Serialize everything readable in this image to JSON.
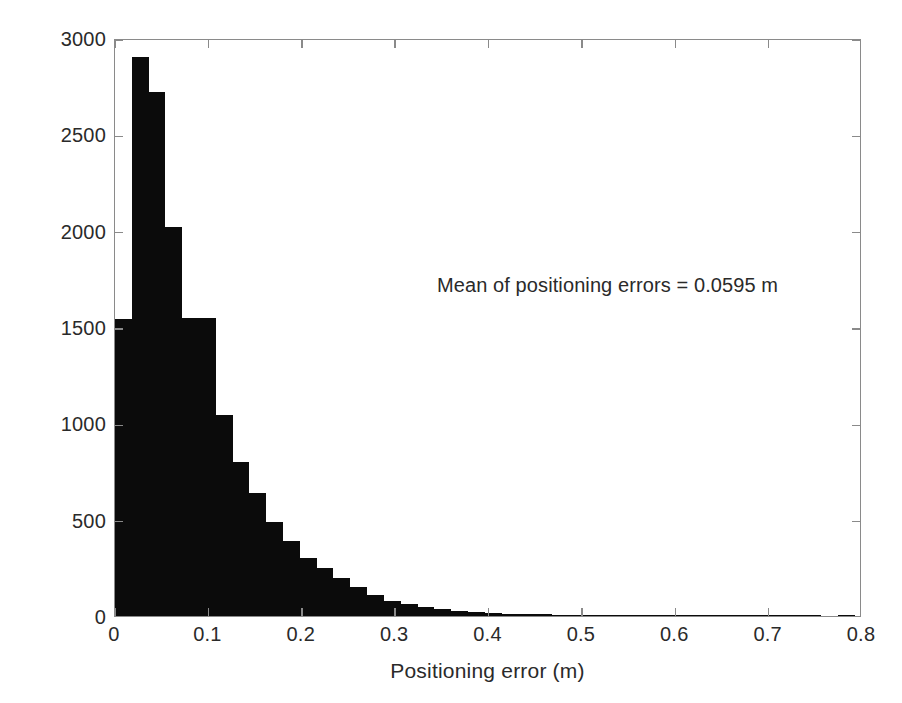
{
  "chart_data": {
    "type": "bar",
    "title": "",
    "subtitle": "",
    "xlabel": "Positioning error (m)",
    "ylabel": "Number of positioning errors",
    "xlim": [
      0,
      0.8
    ],
    "ylim": [
      0,
      3000
    ],
    "grid": false,
    "legend": null,
    "bin_width": 0.018,
    "xticks": [
      "0",
      "0.1",
      "0.2",
      "0.3",
      "0.4",
      "0.5",
      "0.6",
      "0.7",
      "0.8"
    ],
    "xtick_values": [
      0,
      0.1,
      0.2,
      0.3,
      0.4,
      0.5,
      0.6,
      0.7,
      0.8
    ],
    "yticks": [
      "0",
      "500",
      "1000",
      "1500",
      "2000",
      "2500",
      "3000"
    ],
    "ytick_values": [
      0,
      500,
      1000,
      1500,
      2000,
      2500,
      3000
    ],
    "bar_color": "#0b0b0b",
    "frame_color": "#8a8a8a",
    "annotations": [
      {
        "text": "Mean of positioning errors = 0.0595 m",
        "x": 0.345,
        "y": 1780
      }
    ],
    "bin_edges": [
      0.0,
      0.018,
      0.036,
      0.054,
      0.072,
      0.09,
      0.108,
      0.126,
      0.144,
      0.162,
      0.18,
      0.198,
      0.216,
      0.234,
      0.252,
      0.27,
      0.288,
      0.306,
      0.324,
      0.342,
      0.36,
      0.378,
      0.396,
      0.414,
      0.432,
      0.45,
      0.468,
      0.486,
      0.504,
      0.522,
      0.54,
      0.558,
      0.576,
      0.594,
      0.612,
      0.63,
      0.648,
      0.666,
      0.684,
      0.702,
      0.72,
      0.738,
      0.756,
      0.774,
      0.792
    ],
    "categories": [
      "0.000-0.018",
      "0.018-0.036",
      "0.036-0.054",
      "0.054-0.072",
      "0.072-0.090",
      "0.090-0.108",
      "0.108-0.126",
      "0.126-0.144",
      "0.144-0.162",
      "0.162-0.180",
      "0.180-0.198",
      "0.198-0.216",
      "0.216-0.234",
      "0.234-0.252",
      "0.252-0.270",
      "0.270-0.288",
      "0.288-0.306",
      "0.306-0.324",
      "0.324-0.342",
      "0.342-0.360",
      "0.360-0.378",
      "0.378-0.396",
      "0.396-0.414",
      "0.414-0.432",
      "0.432-0.450",
      "0.450-0.468",
      "0.468-0.486",
      "0.486-0.504",
      "0.504-0.522",
      "0.522-0.540",
      "0.540-0.558",
      "0.558-0.576",
      "0.576-0.594",
      "0.594-0.612",
      "0.612-0.630",
      "0.630-0.648",
      "0.648-0.666",
      "0.666-0.684",
      "0.684-0.702",
      "0.702-0.720",
      "0.720-0.738",
      "0.738-0.756",
      "0.756-0.774",
      "0.774-0.792"
    ],
    "values": [
      1540,
      2900,
      2720,
      2020,
      1545,
      1545,
      1045,
      800,
      640,
      490,
      390,
      300,
      250,
      195,
      150,
      110,
      80,
      62,
      45,
      34,
      26,
      20,
      16,
      12,
      10,
      9,
      7,
      3,
      2,
      5,
      2,
      2,
      1,
      1,
      1,
      1,
      1,
      1,
      1,
      1,
      6,
      1,
      0,
      1
    ]
  }
}
